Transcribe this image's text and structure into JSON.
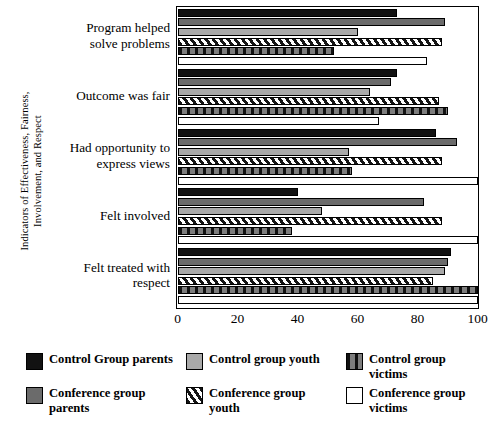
{
  "chart_data": {
    "type": "bar",
    "orientation": "horizontal",
    "title": "",
    "xlabel": "",
    "ylabel": "Indicators of Effectiveness, Fairness, Involvement, and Respect",
    "ylabel_lines": [
      "Indicators of Effectiveness, Fairness,",
      "Involvement, and Respect"
    ],
    "xlim": [
      0,
      100
    ],
    "xticks": [
      0,
      20,
      40,
      60,
      80,
      100
    ],
    "xtick_labels": [
      "0",
      "20",
      "40",
      "60",
      "80",
      "100"
    ],
    "grid": false,
    "legend_position": "bottom",
    "categories": [
      "Program helped solve problems",
      "Outcome was fair",
      "Had opportunity to express views",
      "Felt involved",
      "Felt treated with respect"
    ],
    "category_label_lines": [
      [
        "Program helped",
        "solve problems"
      ],
      [
        "Outcome was fair"
      ],
      [
        "Had opportunity to",
        "express views"
      ],
      [
        "Felt involved"
      ],
      [
        "Felt treated with",
        "respect"
      ]
    ],
    "series": [
      {
        "name": "Control Group parents",
        "key": "s-cgp",
        "swatch": "solid-black",
        "color": "#121212",
        "values": [
          73,
          73,
          86,
          40,
          91
        ]
      },
      {
        "name": "Conference group parents",
        "key": "s-confp",
        "swatch": "solid-grey",
        "color": "#6b6b6b",
        "values": [
          89,
          71,
          93,
          82,
          90
        ]
      },
      {
        "name": "Control group youth",
        "key": "s-cgy",
        "swatch": "solid-light-grey",
        "color": "#a9a9a9",
        "values": [
          60,
          64,
          57,
          48,
          89
        ]
      },
      {
        "name": "Conference group youth",
        "key": "s-confy",
        "swatch": "diagonal-stripes",
        "color": "#151515",
        "values": [
          88,
          87,
          88,
          88,
          85
        ]
      },
      {
        "name": "Control group victims",
        "key": "s-cgv",
        "swatch": "vertical-stripes",
        "color": "#585858",
        "values": [
          52,
          90,
          58,
          38,
          100
        ]
      },
      {
        "name": "Conference group victims",
        "key": "s-confv",
        "swatch": "white-empty",
        "color": "#ffffff",
        "values": [
          83,
          67,
          100,
          100,
          100
        ]
      }
    ]
  },
  "legend": {
    "items": [
      {
        "label": "Control Group parents",
        "key": "s-cgp"
      },
      {
        "label": "Control group youth",
        "key": "s-cgy"
      },
      {
        "label": "Control group victims",
        "key": "s-cgv"
      },
      {
        "label": "Conference group parents",
        "key": "s-confp"
      },
      {
        "label": "Conference group youth",
        "key": "s-confy"
      },
      {
        "label": "Conference group victims",
        "key": "s-confv"
      }
    ]
  }
}
